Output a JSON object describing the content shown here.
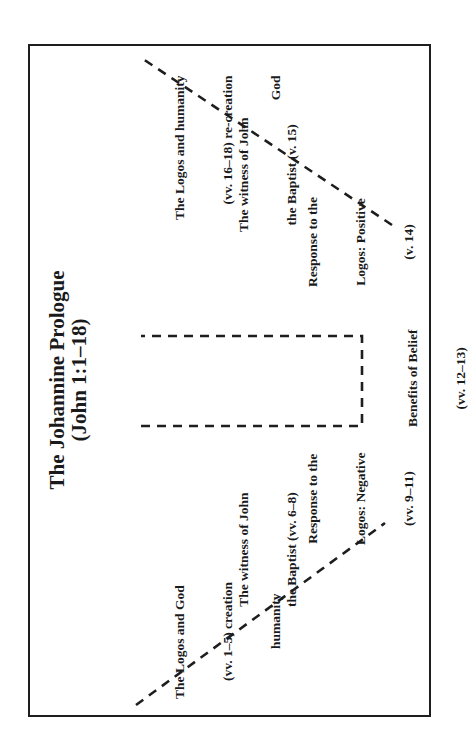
{
  "diagram": {
    "title_line1": "The Johannine Prologue",
    "title_line2": "(John 1:1–18)",
    "left_side": [
      {
        "id": "logos-and-god",
        "lines": [
          "The Logos and God",
          "(vv. 1–5) creation",
          "humanity"
        ]
      },
      {
        "id": "witness-john-6-8",
        "lines": [
          "The witness of John",
          "the Baptist (vv. 6–8)"
        ]
      },
      {
        "id": "response-negative",
        "lines": [
          "Response to the",
          "Logos: Negative",
          "(vv. 9–11)"
        ]
      }
    ],
    "center": [
      {
        "id": "benefits-of-belief",
        "lines": [
          "Benefits of Belief",
          "(vv. 12–13)"
        ]
      }
    ],
    "right_side": [
      {
        "id": "response-positive",
        "lines": [
          "Response to the",
          "Logos: Positive",
          "(v. 14)"
        ]
      },
      {
        "id": "witness-john-15",
        "lines": [
          "The witness of John",
          "the Baptist (v. 15)"
        ]
      },
      {
        "id": "logos-and-humanity",
        "lines": [
          "The Logos and humanity",
          "(vv. 16–18) re-creation",
          "God"
        ]
      }
    ],
    "colors": {
      "line": "#1e1e1e",
      "text": "#1a1a1a",
      "background": "#ffffff"
    }
  }
}
